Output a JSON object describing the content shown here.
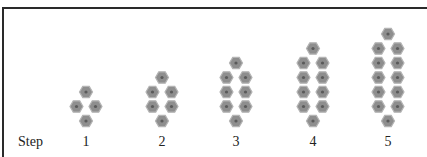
{
  "figure": {
    "row_label": "Step",
    "colors": {
      "hex_fill": "#8e8e8e",
      "hex_stroke": "#b4b4b4",
      "hex_center": "#5a5a5a",
      "frame": "#2a2a2a"
    },
    "steps": [
      {
        "label": "1",
        "center_x": 86,
        "tiles": 4
      },
      {
        "label": "2",
        "center_x": 162,
        "tiles": 6
      },
      {
        "label": "3",
        "center_x": 236,
        "tiles": 8
      },
      {
        "label": "4",
        "center_x": 313,
        "tiles": 10
      },
      {
        "label": "5",
        "center_x": 388,
        "tiles": 12
      }
    ]
  }
}
